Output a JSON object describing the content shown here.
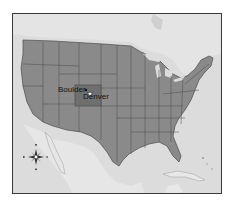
{
  "map": {
    "title": "United States",
    "highlighted_state": "Colorado",
    "colors": {
      "ocean": "#dcdcdc",
      "neighbor_land": "#e6e6e6",
      "states": "#8a8a8a",
      "highlight": "#6f6f6f",
      "borders": "#4a4a4a",
      "frame": "#3a3a3a"
    },
    "cities": [
      {
        "name": "Boulder",
        "marker": "dot"
      },
      {
        "name": "Denver",
        "marker": "star",
        "capital": true
      }
    ],
    "compass": {
      "icon": "compass-rose-icon",
      "directions": [
        "N",
        "E",
        "S",
        "W"
      ]
    }
  }
}
